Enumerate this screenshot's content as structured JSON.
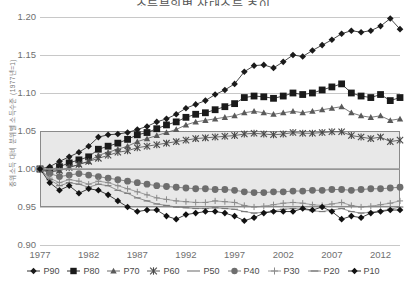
{
  "title": "소득분위별 상대소득 추이",
  "axes": {
    "ylabel": "중위소득 대비 분위별 소득수준 (1977년=1)",
    "yticks": [
      "1.20",
      "1.15",
      "1.10",
      "1.05",
      "1.00",
      "0.95",
      "0.90"
    ],
    "xticks": [
      "1977",
      "1982",
      "1987",
      "1992",
      "1997",
      "2002",
      "2007",
      "2012"
    ]
  },
  "legend": [
    {
      "key": "P90",
      "label": "P90",
      "marker": "diamond",
      "color": "#1a1a1a"
    },
    {
      "key": "P80",
      "label": "P80",
      "marker": "square",
      "color": "#1a1a1a"
    },
    {
      "key": "P70",
      "label": "P70",
      "marker": "triangle",
      "color": "#5a5a5a"
    },
    {
      "key": "P60",
      "label": "P60",
      "marker": "star",
      "color": "#4a4a4a"
    },
    {
      "key": "P50",
      "label": "P50",
      "marker": "line",
      "color": "#9a9a9a"
    },
    {
      "key": "P40",
      "label": "P40",
      "marker": "circle",
      "color": "#6e6e6e"
    },
    {
      "key": "P30",
      "label": "P30",
      "marker": "plus",
      "color": "#8a8a8a"
    },
    {
      "key": "P20",
      "label": "P20",
      "marker": "dash",
      "color": "#7a7a7a"
    },
    {
      "key": "P10",
      "label": "P10",
      "marker": "diamond",
      "color": "#111111"
    }
  ],
  "chart_data": {
    "type": "line",
    "title": "소득분위별 상대소득 추이",
    "xlabel": "",
    "ylabel": "중위소득 대비 분위별 소득수준 (1977년=1)",
    "xlim": [
      1977,
      2014
    ],
    "ylim": [
      0.9,
      1.2
    ],
    "ytick_step": 0.05,
    "grid": true,
    "legend_position": "bottom",
    "shaded_band": {
      "from": 0.95,
      "to": 1.05,
      "midline": 1.0
    },
    "x": [
      1977,
      1978,
      1979,
      1980,
      1981,
      1982,
      1983,
      1984,
      1985,
      1986,
      1987,
      1988,
      1989,
      1990,
      1991,
      1992,
      1993,
      1994,
      1995,
      1996,
      1997,
      1998,
      1999,
      2000,
      2001,
      2002,
      2003,
      2004,
      2005,
      2006,
      2007,
      2008,
      2009,
      2010,
      2011,
      2012,
      2013,
      2014
    ],
    "series": [
      {
        "name": "P90",
        "marker": "diamond",
        "color": "#1a1a1a",
        "values": [
          1.0,
          1.003,
          1.01,
          1.016,
          1.022,
          1.03,
          1.042,
          1.045,
          1.046,
          1.048,
          1.052,
          1.056,
          1.062,
          1.066,
          1.072,
          1.08,
          1.085,
          1.09,
          1.098,
          1.104,
          1.112,
          1.128,
          1.136,
          1.137,
          1.133,
          1.141,
          1.15,
          1.148,
          1.156,
          1.163,
          1.17,
          1.178,
          1.182,
          1.18,
          1.182,
          1.188,
          1.198,
          1.184
        ]
      },
      {
        "name": "P80",
        "marker": "square",
        "color": "#1a1a1a",
        "values": [
          1.0,
          0.998,
          1.003,
          1.008,
          1.012,
          1.016,
          1.026,
          1.03,
          1.034,
          1.039,
          1.045,
          1.048,
          1.053,
          1.058,
          1.062,
          1.068,
          1.072,
          1.074,
          1.078,
          1.082,
          1.086,
          1.094,
          1.096,
          1.095,
          1.093,
          1.096,
          1.1,
          1.098,
          1.1,
          1.104,
          1.108,
          1.112,
          1.1,
          1.096,
          1.094,
          1.098,
          1.09,
          1.094
        ]
      },
      {
        "name": "P70",
        "marker": "triangle",
        "color": "#5a5a5a",
        "values": [
          1.0,
          0.996,
          0.998,
          1.002,
          1.006,
          1.01,
          1.018,
          1.022,
          1.026,
          1.03,
          1.036,
          1.04,
          1.044,
          1.048,
          1.052,
          1.058,
          1.062,
          1.064,
          1.066,
          1.068,
          1.07,
          1.074,
          1.076,
          1.074,
          1.072,
          1.074,
          1.076,
          1.074,
          1.076,
          1.078,
          1.08,
          1.082,
          1.074,
          1.07,
          1.068,
          1.07,
          1.064,
          1.066
        ]
      },
      {
        "name": "P60",
        "marker": "star",
        "color": "#4a4a4a",
        "values": [
          1.0,
          0.997,
          0.998,
          1.002,
          1.006,
          1.01,
          1.014,
          1.018,
          1.022,
          1.024,
          1.028,
          1.03,
          1.032,
          1.034,
          1.036,
          1.038,
          1.04,
          1.041,
          1.042,
          1.043,
          1.044,
          1.046,
          1.047,
          1.046,
          1.045,
          1.046,
          1.048,
          1.047,
          1.047,
          1.048,
          1.049,
          1.049,
          1.044,
          1.042,
          1.04,
          1.042,
          1.036,
          1.038
        ]
      },
      {
        "name": "P50",
        "marker": "line",
        "color": "#9a9a9a",
        "values": [
          1.0,
          1.0,
          1.0,
          1.0,
          1.0,
          1.0,
          1.0,
          1.0,
          1.0,
          1.0,
          1.0,
          1.0,
          1.0,
          1.0,
          1.0,
          1.0,
          1.0,
          1.0,
          1.0,
          1.0,
          1.0,
          1.0,
          1.0,
          1.0,
          1.0,
          1.0,
          1.0,
          1.0,
          1.0,
          1.0,
          1.0,
          1.0,
          1.0,
          1.0,
          1.0,
          1.0,
          1.0,
          1.0
        ]
      },
      {
        "name": "P40",
        "marker": "circle",
        "color": "#6e6e6e",
        "values": [
          1.0,
          0.994,
          0.99,
          0.992,
          0.994,
          0.992,
          0.99,
          0.988,
          0.986,
          0.984,
          0.982,
          0.98,
          0.978,
          0.977,
          0.976,
          0.975,
          0.974,
          0.974,
          0.973,
          0.973,
          0.972,
          0.97,
          0.969,
          0.969,
          0.97,
          0.97,
          0.971,
          0.971,
          0.972,
          0.972,
          0.973,
          0.973,
          0.972,
          0.973,
          0.974,
          0.974,
          0.975,
          0.976
        ]
      },
      {
        "name": "P30",
        "marker": "plus",
        "color": "#8a8a8a",
        "values": [
          1.0,
          0.988,
          0.982,
          0.986,
          0.984,
          0.98,
          0.984,
          0.982,
          0.978,
          0.974,
          0.97,
          0.966,
          0.962,
          0.96,
          0.958,
          0.957,
          0.956,
          0.956,
          0.958,
          0.957,
          0.956,
          0.952,
          0.95,
          0.951,
          0.953,
          0.955,
          0.956,
          0.955,
          0.953,
          0.952,
          0.954,
          0.956,
          0.952,
          0.95,
          0.951,
          0.953,
          0.955,
          0.958
        ]
      },
      {
        "name": "P20",
        "marker": "dash",
        "color": "#7a7a7a",
        "values": [
          1.0,
          0.986,
          0.978,
          0.982,
          0.98,
          0.976,
          0.98,
          0.978,
          0.972,
          0.968,
          0.962,
          0.958,
          0.954,
          0.952,
          0.95,
          0.949,
          0.948,
          0.948,
          0.949,
          0.948,
          0.947,
          0.944,
          0.942,
          0.943,
          0.945,
          0.947,
          0.948,
          0.947,
          0.945,
          0.944,
          0.946,
          0.948,
          0.944,
          0.942,
          0.943,
          0.945,
          0.947,
          0.95
        ]
      },
      {
        "name": "P10",
        "marker": "diamond",
        "color": "#111111",
        "values": [
          1.0,
          0.982,
          0.972,
          0.978,
          0.968,
          0.974,
          0.972,
          0.966,
          0.958,
          0.95,
          0.944,
          0.946,
          0.946,
          0.938,
          0.934,
          0.94,
          0.942,
          0.944,
          0.944,
          0.942,
          0.938,
          0.932,
          0.936,
          0.942,
          0.944,
          0.944,
          0.944,
          0.948,
          0.946,
          0.95,
          0.944,
          0.934,
          0.938,
          0.936,
          0.942,
          0.944,
          0.946,
          0.946
        ]
      }
    ]
  }
}
